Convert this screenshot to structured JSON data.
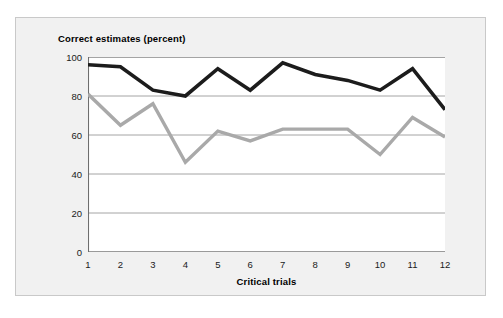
{
  "chart_data": {
    "type": "line",
    "title": "Correct estimates (percent)",
    "xlabel": "Critical trials",
    "ylabel": "",
    "categories": [
      "1",
      "2",
      "3",
      "4",
      "5",
      "6",
      "7",
      "8",
      "9",
      "10",
      "11",
      "12"
    ],
    "x": [
      1,
      2,
      3,
      4,
      5,
      6,
      7,
      8,
      9,
      10,
      11,
      12
    ],
    "xlim": [
      1,
      12
    ],
    "ylim": [
      0,
      100
    ],
    "yticks": [
      "0",
      "20",
      "40",
      "60",
      "80",
      "100"
    ],
    "ytick_values": [
      0,
      20,
      40,
      60,
      80,
      100
    ],
    "grid": "horizontal",
    "legend": "none",
    "series": [
      {
        "name": "black-series",
        "color": "#1c1c1c",
        "values": [
          96,
          95,
          83,
          80,
          94,
          83,
          97,
          91,
          88,
          83,
          94,
          73
        ]
      },
      {
        "name": "gray-series",
        "color": "#a9a9a9",
        "values": [
          81,
          65,
          76,
          46,
          62,
          57,
          63,
          63,
          63,
          50,
          69,
          59
        ]
      }
    ]
  },
  "style": {
    "frame_background": "#f1f1f1",
    "frame_border": "#c9c9c9",
    "plot_background": "#ffffff",
    "gridline_color": "#9a9a9a",
    "axis_color": "#6e6e6e",
    "text_color": "#1a1a1a"
  }
}
